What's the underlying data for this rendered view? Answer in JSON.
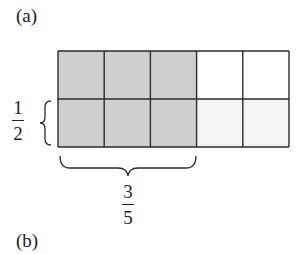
{
  "labels": {
    "part_a": "(a)",
    "part_b": "(b)"
  },
  "grid": {
    "rows": 2,
    "columns": 5,
    "origin": [
      58,
      51
    ],
    "cell_width": 46.2,
    "cell_height": 48,
    "shaded_cells": [
      [
        1,
        1,
        1,
        0,
        0
      ],
      [
        1,
        1,
        1,
        0,
        0
      ]
    ],
    "colors": {
      "shaded": "#cfcfcf",
      "unshaded_top": "#ffffff",
      "unshaded_bottom": "#f4f4f4",
      "line": "#2b2b2b"
    }
  },
  "fractions": {
    "left": {
      "numerator": "1",
      "denominator": "2",
      "meaning": "bottom row (1 of 2 rows)"
    },
    "bottom": {
      "numerator": "3",
      "denominator": "5",
      "meaning": "first 3 of 5 columns"
    }
  }
}
